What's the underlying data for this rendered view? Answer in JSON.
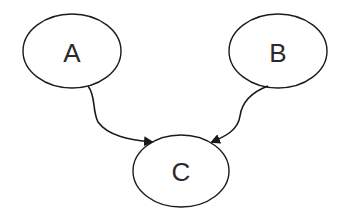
{
  "diagram": {
    "type": "directed-graph",
    "nodes": [
      {
        "id": "A",
        "label": "A",
        "cx": 72,
        "cy": 51,
        "rx": 49,
        "ry": 37
      },
      {
        "id": "B",
        "label": "B",
        "cx": 278,
        "cy": 51,
        "rx": 49,
        "ry": 37
      },
      {
        "id": "C",
        "label": "C",
        "cx": 181,
        "cy": 171,
        "rx": 48,
        "ry": 36
      }
    ],
    "edges": [
      {
        "from": "A",
        "to": "C"
      },
      {
        "from": "B",
        "to": "C"
      }
    ],
    "colors": {
      "stroke": "#1a1a1a",
      "fill": "#ffffff",
      "text": "#2a2a2a"
    }
  }
}
